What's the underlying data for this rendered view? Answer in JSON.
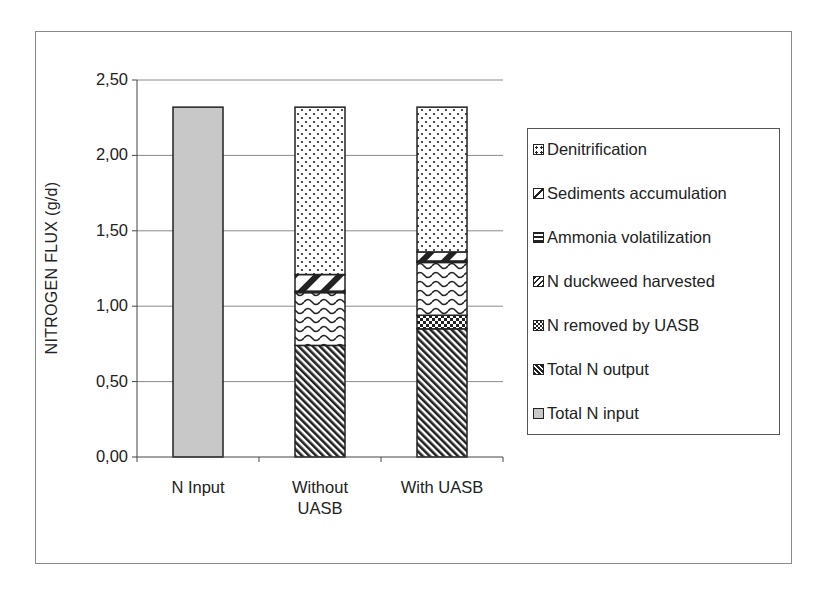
{
  "chart_data": {
    "type": "bar",
    "stacked": true,
    "title": "",
    "xlabel": "",
    "ylabel": "NITROGEN FLUX (g/d)",
    "ylim": [
      0,
      2.5
    ],
    "yticks": [
      "0,00",
      "0,50",
      "1,00",
      "1,50",
      "2,00",
      "2,50"
    ],
    "ytick_values": [
      0,
      0.5,
      1.0,
      1.5,
      2.0,
      2.5
    ],
    "grid": true,
    "legend_position": "right",
    "categories": [
      "N Input",
      "Without UASB",
      "With UASB"
    ],
    "category_labels": [
      [
        "N Input"
      ],
      [
        "Without",
        "UASB"
      ],
      [
        "With UASB"
      ]
    ],
    "series": [
      {
        "name": "Total N input",
        "pattern": "solid-gray",
        "values": [
          2.32,
          0,
          0
        ]
      },
      {
        "name": "Total N output",
        "pattern": "diagonal-dense",
        "values": [
          0,
          0.74,
          0.85
        ]
      },
      {
        "name": "N removed by UASB",
        "pattern": "checkered",
        "values": [
          0,
          0,
          0.09
        ]
      },
      {
        "name": "N duckweed harvested",
        "pattern": "wavy",
        "values": [
          0,
          0.35,
          0.35
        ]
      },
      {
        "name": "Ammonia volatilization",
        "pattern": "horizontal",
        "values": [
          0,
          0.01,
          0.01
        ]
      },
      {
        "name": "Sediments accumulation",
        "pattern": "wide-diagonal",
        "values": [
          0,
          0.11,
          0.06
        ]
      },
      {
        "name": "Denitrification",
        "pattern": "dots",
        "values": [
          0,
          1.11,
          0.96
        ]
      }
    ],
    "totals": [
      2.32,
      2.32,
      2.32
    ]
  },
  "legend": {
    "items": [
      {
        "label": "Denitrification",
        "pattern": "dots"
      },
      {
        "label": "Sediments accumulation",
        "pattern": "wide-diagonal"
      },
      {
        "label": "Ammonia volatilization",
        "pattern": "horizontal"
      },
      {
        "label": "N duckweed harvested",
        "pattern": "wavy"
      },
      {
        "label": "N removed by UASB",
        "pattern": "checkered"
      },
      {
        "label": "Total N output",
        "pattern": "diagonal-dense"
      },
      {
        "label": "Total N input",
        "pattern": "solid-gray"
      }
    ]
  },
  "colors": {
    "input_fill": "#c8c8c8",
    "ink": "#222222",
    "grid": "#8a8a8a"
  }
}
